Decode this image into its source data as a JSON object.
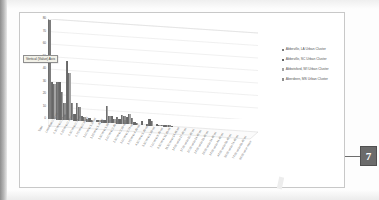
{
  "callout": {
    "number": "7"
  },
  "tooltip": {
    "label": "Vertical (Value) Axis"
  },
  "legend": {
    "position": "right",
    "entries": [
      {
        "label": "Abbeville, LA Urban Cluster",
        "color": "#7d7d7d"
      },
      {
        "label": "Abbeville, SC Urban Cluster",
        "color": "#676767"
      },
      {
        "label": "Abbotsford, WI Urban Cluster",
        "color": "#a4a4a4"
      },
      {
        "label": "Aberdeen, MS Urban Cluster",
        "color": "#909090"
      }
    ]
  },
  "chart_data": {
    "type": "bar",
    "title": "",
    "subtitle": "",
    "xlabel": "",
    "ylabel": "",
    "ylim": [
      0,
      80
    ],
    "yticks": [
      0,
      10,
      20,
      30,
      40,
      50,
      60,
      70,
      80
    ],
    "grid": true,
    "three_d": true,
    "legend_position": "right",
    "categories": [
      "Total",
      "Less than 0.10 mi",
      "0.10 mi to 0.24 mi",
      "0.25 mi to 0.49 mi",
      "0.50 mi to 0.74 mi",
      "0.75 mi to 0.99 mi",
      "1.00 mi to 1.24 mi",
      "1.25 mi to 1.49 mi",
      "1.50 mi to 1.99 mi",
      "2.00 mi to 2.49 mi",
      "2.50 mi to 2.99 mi",
      "3.00 mi to 3.74 mi",
      "3.75 mi to 4.49 mi",
      "4.50 mi to 5.49 mi",
      "5.50 mi to 6.99 mi",
      "7.00 mi to 8.49 mi",
      "8.50 mi to 11.49 mi",
      "11.50 mi to 14.49 mi",
      "14.50 mi to 17.49 mi",
      "17.50 mi to 20.49 mi",
      "20.50 mi to 24.49 mi",
      "24.50 mi to 29.49 mi",
      "29.50 mi to 34.49 mi",
      "34.50 mi to 44.49 mi",
      "44.50 mi to 59.49 mi",
      "59.50 mi to 74.49 mi",
      "74.50 mi to 99.49 mi",
      "99.50 mi or more"
    ],
    "series": [
      {
        "name": "Abbeville, LA Urban Cluster",
        "color": "#7d7d7d",
        "values": [
          79,
          30,
          4,
          0,
          0,
          1,
          0,
          2,
          0,
          5,
          3,
          0,
          0,
          1,
          0,
          0,
          0,
          0,
          0,
          0,
          0,
          0,
          0,
          0,
          0,
          0,
          0,
          0
        ]
      },
      {
        "name": "Abbeville, SC Urban Cluster",
        "color": "#676767",
        "values": [
          30,
          30,
          47,
          5,
          4,
          3,
          2,
          2,
          6,
          4,
          6,
          2,
          3,
          5,
          2,
          1,
          1,
          0,
          0,
          0,
          0,
          0,
          0,
          0,
          0,
          0,
          0,
          0
        ]
      },
      {
        "name": "Abbotsford, WI Urban Cluster",
        "color": "#a4a4a4",
        "values": [
          28,
          22,
          38,
          14,
          3,
          1,
          2,
          13,
          3,
          7,
          8,
          1,
          0,
          4,
          1,
          1,
          0,
          0,
          0,
          0,
          0,
          0,
          0,
          0,
          0,
          0,
          0,
          0
        ]
      },
      {
        "name": "Aberdeen, MS Urban Cluster",
        "color": "#909090",
        "values": [
          26,
          13,
          14,
          11,
          2,
          0,
          1,
          5,
          2,
          6,
          5,
          0,
          0,
          0,
          1,
          1,
          0,
          0,
          0,
          0,
          0,
          0,
          0,
          0,
          0,
          0,
          0,
          0
        ]
      }
    ]
  }
}
